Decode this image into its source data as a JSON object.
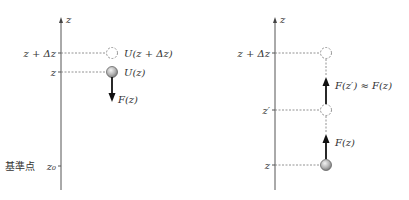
{
  "left_panel": {
    "axis_label": "z",
    "ticks": [
      {
        "label": "z + Δz",
        "y": 53
      },
      {
        "label": "z",
        "y": 72
      },
      {
        "label": "z₀",
        "y": 166
      }
    ],
    "reference_point_label": "基準点",
    "ball_label": "U(z)",
    "ghost_label": "U(z + Δz)",
    "force_label": "F(z)"
  },
  "right_panel": {
    "axis_label": "z",
    "ticks": [
      {
        "label": "z + Δz",
        "y": 53
      },
      {
        "label": "z′",
        "y": 110
      },
      {
        "label": "z",
        "y": 165
      }
    ],
    "upper_force_label": "F(z′) ≈ F(z)",
    "lower_force_label": "F(z)"
  },
  "colors": {
    "axis": "#555555",
    "ball_fill": "#b0b0b0",
    "ball_stroke": "#666666",
    "force_arrow": "#111111",
    "dashed": "#777777"
  }
}
